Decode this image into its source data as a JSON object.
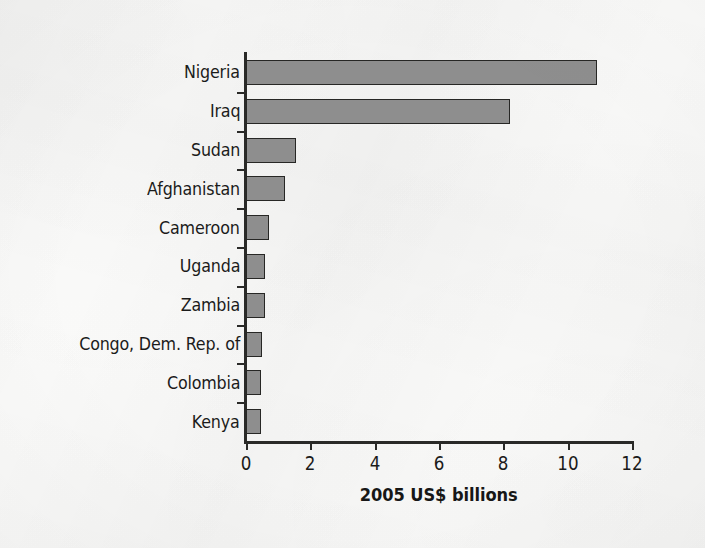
{
  "figure": {
    "background_color": "#fafaf9",
    "ink_color": "#1b1b1a",
    "bar_fill_color": "#8e8e8e",
    "bar_edge_color": "#272725"
  },
  "chart_data": {
    "type": "bar",
    "orientation": "horizontal",
    "title": "",
    "subtitle": "",
    "xlabel": "2005 US$ billions",
    "ylabel": "",
    "xlim": [
      0,
      12
    ],
    "xticks": [
      0,
      2,
      4,
      6,
      8,
      10,
      12
    ],
    "xtick_labels": [
      "0",
      "2",
      "4",
      "6",
      "8",
      "10",
      "12"
    ],
    "grid": false,
    "legend": null,
    "legend_position": "none",
    "categories": [
      "Nigeria",
      "Iraq",
      "Sudan",
      "Afghanistan",
      "Cameroon",
      "Uganda",
      "Zambia",
      "Congo, Dem. Rep. of",
      "Colombia",
      "Kenya"
    ],
    "values": [
      10.9,
      8.2,
      1.55,
      1.2,
      0.72,
      0.6,
      0.58,
      0.5,
      0.48,
      0.47
    ],
    "series": [
      {
        "name": "2005 US$ billions",
        "values": [
          10.9,
          8.2,
          1.55,
          1.2,
          0.72,
          0.6,
          0.58,
          0.5,
          0.48,
          0.47
        ]
      }
    ],
    "annotations": []
  }
}
